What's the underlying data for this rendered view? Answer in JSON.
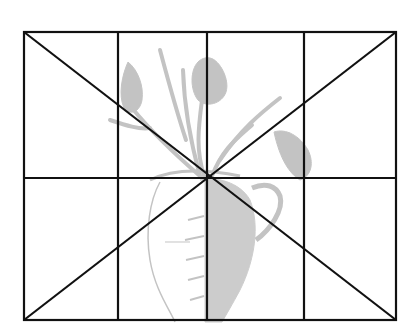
{
  "diagram": {
    "type": "drawing-grid-construction",
    "frame": {
      "left": 24,
      "top": 32,
      "right": 396,
      "bottom": 320
    },
    "vertical_lines_x": [
      118,
      207,
      304
    ],
    "horizontal_lines_y": [
      178
    ],
    "diagonals": [
      {
        "from": "top-left",
        "to": "bottom-right"
      },
      {
        "from": "top-right",
        "to": "bottom-left"
      }
    ],
    "grid": {
      "columns": 4,
      "rows": 2
    },
    "colors": {
      "background": "#ffffff",
      "grid_line": "#111111",
      "sketch": "#b8b8b8"
    }
  }
}
